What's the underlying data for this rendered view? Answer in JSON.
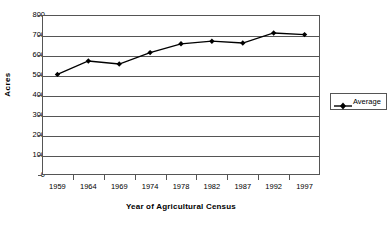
{
  "chart_data": {
    "type": "line",
    "title": "",
    "xlabel": "Year of Agricultural Census",
    "ylabel": "Acres",
    "categories": [
      "1959",
      "1964",
      "1969",
      "1974",
      "1978",
      "1982",
      "1987",
      "1992",
      "1997"
    ],
    "series": [
      {
        "name": "Average",
        "values": [
          503,
          570,
          555,
          612,
          656,
          669,
          660,
          710,
          702
        ]
      }
    ],
    "ylim": [
      0,
      800
    ],
    "y_ticks": [
      0,
      100,
      200,
      300,
      400,
      500,
      600,
      700,
      800
    ],
    "y_tick_labels": [
      "0",
      "100",
      "200",
      "300",
      "400",
      "500",
      "600",
      "700",
      "800"
    ],
    "grid": true,
    "legend_position": "right",
    "marker": "diamond",
    "line_color": "#000000",
    "marker_color": "#000000",
    "background_color": "#ffffff",
    "axis_color": "#555555"
  },
  "legend": {
    "entries": [
      {
        "label": "Average"
      }
    ]
  }
}
